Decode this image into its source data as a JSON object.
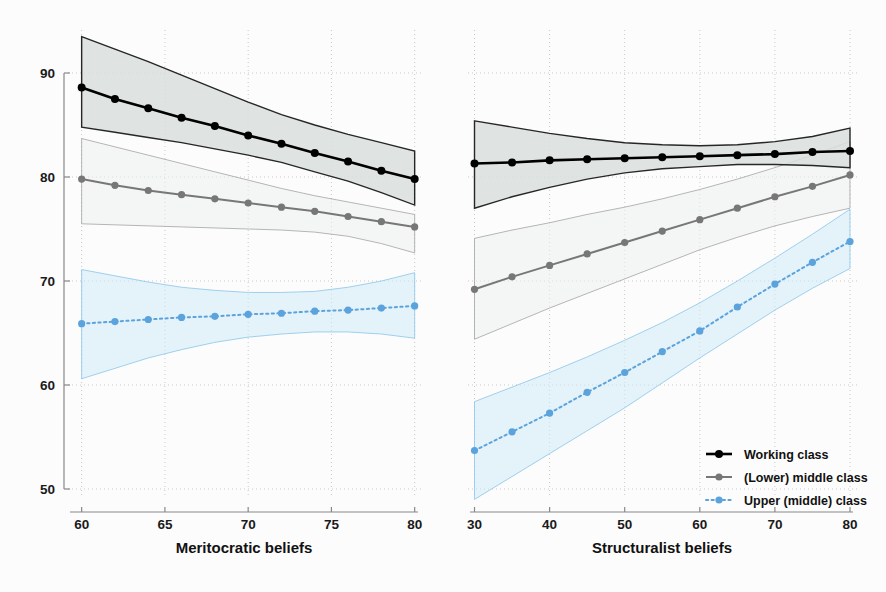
{
  "chart_data": {
    "type": "line",
    "title": "",
    "ylabel": "",
    "ylim": [
      46,
      94
    ],
    "yticks": [
      50,
      60,
      70,
      80,
      90
    ],
    "grid": "dotted",
    "legend_position": "bottom-right",
    "legend": [
      {
        "name": "Working class",
        "color": "#000000",
        "dash": "solid",
        "marker": "circle"
      },
      {
        "name": "(Lower) middle class",
        "color": "#777777",
        "dash": "solid",
        "marker": "circle"
      },
      {
        "name": "Upper (middle) class",
        "color": "#5BA3DC",
        "dash": "dotted",
        "marker": "circle"
      }
    ],
    "panels": [
      {
        "id": "left",
        "xlabel": "Meritocratic beliefs",
        "xlim": [
          59.3,
          80.2
        ],
        "xticks": [
          60,
          65,
          70,
          75,
          80
        ],
        "x": [
          60,
          62,
          64,
          66,
          68,
          70,
          72,
          74,
          76,
          78,
          80
        ],
        "series": [
          {
            "name": "Working class",
            "color": "#000000",
            "values": [
              88.6,
              87.5,
              86.6,
              85.7,
              84.9,
              84.0,
              83.2,
              82.3,
              81.5,
              80.6,
              79.8
            ],
            "ci_upper": [
              93.5,
              92.3,
              91.1,
              89.8,
              88.5,
              87.2,
              86.0,
              85.0,
              84.1,
              83.3,
              82.5
            ],
            "ci_lower": [
              84.8,
              84.3,
              83.8,
              83.3,
              82.7,
              82.1,
              81.4,
              80.5,
              79.6,
              78.5,
              77.3
            ]
          },
          {
            "name": "(Lower) middle class",
            "color": "#777777",
            "values": [
              79.8,
              79.2,
              78.7,
              78.3,
              77.9,
              77.5,
              77.1,
              76.7,
              76.2,
              75.7,
              75.2
            ],
            "ci_upper": [
              83.7,
              82.9,
              82.1,
              81.3,
              80.5,
              79.7,
              78.9,
              78.2,
              77.6,
              77.0,
              76.4
            ],
            "ci_lower": [
              75.5,
              75.4,
              75.3,
              75.2,
              75.1,
              75.0,
              74.9,
              74.7,
              74.3,
              73.6,
              72.7
            ]
          },
          {
            "name": "Upper (middle) class",
            "color": "#5BA3DC",
            "values": [
              65.9,
              66.1,
              66.3,
              66.5,
              66.6,
              66.8,
              66.9,
              67.1,
              67.2,
              67.4,
              67.6
            ],
            "ci_upper": [
              71.1,
              70.5,
              69.9,
              69.4,
              69.1,
              68.9,
              68.9,
              69.0,
              69.4,
              70.0,
              70.8
            ],
            "ci_lower": [
              60.6,
              61.6,
              62.6,
              63.4,
              64.1,
              64.6,
              64.9,
              65.1,
              65.1,
              64.9,
              64.5
            ]
          }
        ]
      },
      {
        "id": "right",
        "xlabel": "Structuralist beliefs",
        "xlim": [
          29.4,
          80.4
        ],
        "xticks": [
          30,
          40,
          50,
          60,
          70,
          80
        ],
        "x": [
          30,
          35,
          40,
          45,
          50,
          55,
          60,
          65,
          70,
          75,
          80
        ],
        "series": [
          {
            "name": "Working class",
            "color": "#000000",
            "values": [
              81.3,
              81.4,
              81.6,
              81.7,
              81.8,
              81.9,
              82.0,
              82.1,
              82.2,
              82.4,
              82.5
            ],
            "ci_upper": [
              85.4,
              84.8,
              84.2,
              83.7,
              83.3,
              83.1,
              83.0,
              83.1,
              83.4,
              83.9,
              84.7
            ],
            "ci_lower": [
              77.0,
              78.1,
              79.0,
              79.8,
              80.4,
              80.8,
              81.0,
              81.2,
              81.2,
              81.1,
              80.9
            ]
          },
          {
            "name": "(Lower) middle class",
            "color": "#777777",
            "values": [
              69.2,
              70.4,
              71.5,
              72.6,
              73.7,
              74.8,
              75.9,
              77.0,
              78.1,
              79.1,
              80.2
            ],
            "ci_upper": [
              74.1,
              74.9,
              75.6,
              76.4,
              77.1,
              77.9,
              78.8,
              79.8,
              80.9,
              82.1,
              83.4
            ],
            "ci_lower": [
              64.4,
              65.9,
              67.4,
              68.8,
              70.2,
              71.6,
              73.0,
              74.2,
              75.3,
              76.2,
              77.0
            ]
          },
          {
            "name": "Upper (middle) class",
            "color": "#5BA3DC",
            "values": [
              53.7,
              55.5,
              57.3,
              59.3,
              61.2,
              63.2,
              65.2,
              67.5,
              69.7,
              71.8,
              73.8
            ],
            "ci_upper": [
              58.4,
              59.8,
              61.2,
              62.7,
              64.3,
              66.0,
              67.9,
              70.0,
              72.2,
              74.5,
              76.9
            ],
            "ci_lower": [
              49.0,
              51.2,
              53.4,
              55.6,
              57.8,
              60.2,
              62.6,
              64.9,
              67.2,
              69.3,
              71.2
            ]
          }
        ]
      }
    ]
  },
  "axis": {
    "ytick_labels": [
      "90",
      "80",
      "70",
      "60",
      "50"
    ],
    "left_xtick_labels": [
      "60",
      "65",
      "70",
      "75",
      "80"
    ],
    "right_xtick_labels": [
      "30",
      "40",
      "50",
      "60",
      "70",
      "80"
    ],
    "left_xlabel": "Meritocratic beliefs",
    "right_xlabel": "Structuralist beliefs"
  },
  "legend": {
    "items": [
      {
        "label": "Working class",
        "color": "#000000"
      },
      {
        "label": "(Lower) middle class",
        "color": "#777777"
      },
      {
        "label": "Upper (middle) class",
        "color": "#5BA3DC"
      }
    ]
  },
  "colors": {
    "working": "#000000",
    "lower_middle": "#777777",
    "upper_middle": "#5BA3DC",
    "band_dark": "#d9dedc",
    "band_gray": "#eceeef",
    "band_blue": "#cfe9f8",
    "grid": "#c9c9c9",
    "axis": "#888888",
    "background": "#fcfcfc"
  }
}
